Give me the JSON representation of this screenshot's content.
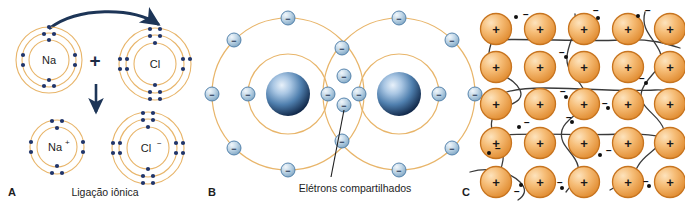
{
  "figure": {
    "background_color": "#ffffff",
    "width": 685,
    "height": 208
  },
  "palette": {
    "shell_orbit": "#e8b56a",
    "electron_dot": "#20356b",
    "arrow_navy": "#1d3557",
    "nucleus_dark": "#1b3a66",
    "nucleus_light": "#cfe0f2",
    "electron_sphere_fill": "#b9cfe0",
    "electron_sphere_stroke": "#4a7ba6",
    "ion_orange_light": "#f7c98b",
    "ion_orange_dark": "#e08a2e",
    "ion_stroke": "#c7741f",
    "path_line": "#3a3a3a",
    "text": "#1d1d1d"
  },
  "panels": [
    {
      "id": "A",
      "letter": "A",
      "name": "ionic-bond-panel",
      "caption": "Ligação iônica",
      "bond_type": "iônica",
      "atoms": [
        {
          "name": "sodium-atom",
          "label": "Na",
          "charge": "",
          "shells": [
            2,
            8,
            1
          ],
          "shell_count": 3,
          "role": "electron donor",
          "position": "top-left"
        },
        {
          "name": "chlorine-atom",
          "label": "Cl",
          "charge": "",
          "shells": [
            2,
            8,
            7
          ],
          "shell_count": 3,
          "role": "electron acceptor",
          "position": "top-right"
        },
        {
          "name": "sodium-ion",
          "label": "Na",
          "charge": "+",
          "shells": [
            2,
            8
          ],
          "shell_count": 2,
          "role": "cation",
          "position": "bottom-left"
        },
        {
          "name": "chloride-ion",
          "label": "Cl",
          "charge": "−",
          "shells": [
            2,
            8,
            8
          ],
          "shell_count": 3,
          "role": "anion",
          "position": "bottom-right"
        }
      ],
      "operator": "+",
      "arrows": [
        {
          "name": "electron-transfer-arrow",
          "style": "curved",
          "direction": "left-to-right"
        },
        {
          "name": "reaction-arrow",
          "style": "straight",
          "direction": "downward"
        }
      ]
    },
    {
      "id": "B",
      "letter": "B",
      "name": "covalent-bond-panel",
      "caption": "Elétrons compartilhados",
      "bond_type": "covalente",
      "atoms": [
        {
          "name": "covalent-atom-left",
          "shells": [
            2,
            8
          ],
          "nucleus": "sphere"
        },
        {
          "name": "covalent-atom-right",
          "shells": [
            2,
            8
          ],
          "nucleus": "sphere"
        }
      ],
      "shared_electron_count": 2,
      "callout": {
        "name": "shared-electrons-callout",
        "label": "Elétrons compartilhados",
        "leader_line": true
      }
    },
    {
      "id": "C",
      "letter": "C",
      "name": "metallic-bond-panel",
      "caption": "",
      "bond_type": "metálica",
      "lattice": {
        "rows": 5,
        "cols": 5,
        "ion_symbol": "+",
        "ion_count": 25
      },
      "free_electrons": {
        "symbol": "−",
        "count": 14,
        "description": "elétrons livres deslocalizados"
      },
      "electron_paths": 5
    }
  ]
}
